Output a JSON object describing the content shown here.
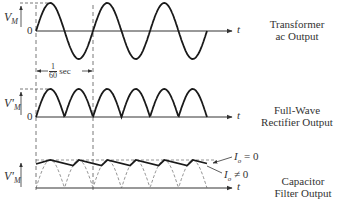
{
  "panels": [
    {
      "id": "transformer",
      "title_lines": [
        "Transformer",
        "ac Output"
      ],
      "y_label": "V",
      "y_label_sub": "M",
      "zero_label": "0",
      "x_label": "t",
      "waveform": "sine",
      "cycles": 3
    },
    {
      "id": "rectifier",
      "title_lines": [
        "Full-Wave",
        "Rectifier Output"
      ],
      "y_label": "V'",
      "y_label_sub": "M",
      "zero_label": "0",
      "x_label": "t",
      "waveform": "full-wave-rectified",
      "humps": 6
    },
    {
      "id": "capacitor",
      "title_lines": [
        "Capacitor",
        "Filter Output"
      ],
      "y_label": "V'",
      "y_label_sub": "M",
      "x_label": "t",
      "waveform": "filtered-ripple",
      "annotations": [
        {
          "var": "I",
          "sub": "o",
          "rel": "= 0"
        },
        {
          "var": "I",
          "sub": "o",
          "rel": "≠ 0"
        }
      ]
    }
  ],
  "period_marker": {
    "numerator": "1",
    "denominator": "60",
    "unit": "sec"
  },
  "colors": {
    "trace": "#1a1a1a",
    "axis": "#333333",
    "dashed": "#555555"
  }
}
